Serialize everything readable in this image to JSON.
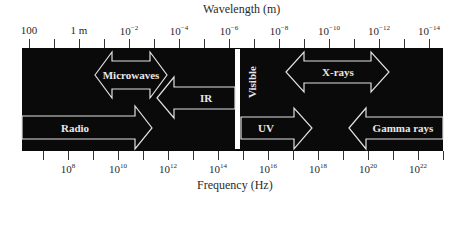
{
  "diagram": {
    "title_top": "Wavelength (m)",
    "title_bottom": "Frequency (Hz)",
    "wavelength_ticks": [
      {
        "base": "100",
        "exp": "",
        "x": 29
      },
      {
        "base": "1 m",
        "exp": "",
        "x": 79
      },
      {
        "base": "10",
        "exp": "−2",
        "x": 129
      },
      {
        "base": "10",
        "exp": "−4",
        "x": 179
      },
      {
        "base": "10",
        "exp": "−6",
        "x": 229
      },
      {
        "base": "10",
        "exp": "−8",
        "x": 279
      },
      {
        "base": "10",
        "exp": "−10",
        "x": 329
      },
      {
        "base": "10",
        "exp": "−12",
        "x": 379
      },
      {
        "base": "10",
        "exp": "−14",
        "x": 429
      }
    ],
    "frequency_ticks": [
      {
        "base": "10",
        "exp": "8",
        "x": 68
      },
      {
        "base": "10",
        "exp": "10",
        "x": 118
      },
      {
        "base": "10",
        "exp": "12",
        "x": 168
      },
      {
        "base": "10",
        "exp": "14",
        "x": 218
      },
      {
        "base": "10",
        "exp": "16",
        "x": 268
      },
      {
        "base": "10",
        "exp": "18",
        "x": 318
      },
      {
        "base": "10",
        "exp": "20",
        "x": 368
      },
      {
        "base": "10",
        "exp": "22",
        "x": 418
      }
    ],
    "regions": {
      "radio": "Radio",
      "microwaves": "Microwaves",
      "ir": "IR",
      "visible": "Visible",
      "uv": "UV",
      "xrays": "X-rays",
      "gamma": "Gamma rays"
    },
    "colors": {
      "band": "#0a0a0a",
      "arrow_stroke": "#e0e0e0",
      "visible_bar": "#ffffff"
    }
  }
}
